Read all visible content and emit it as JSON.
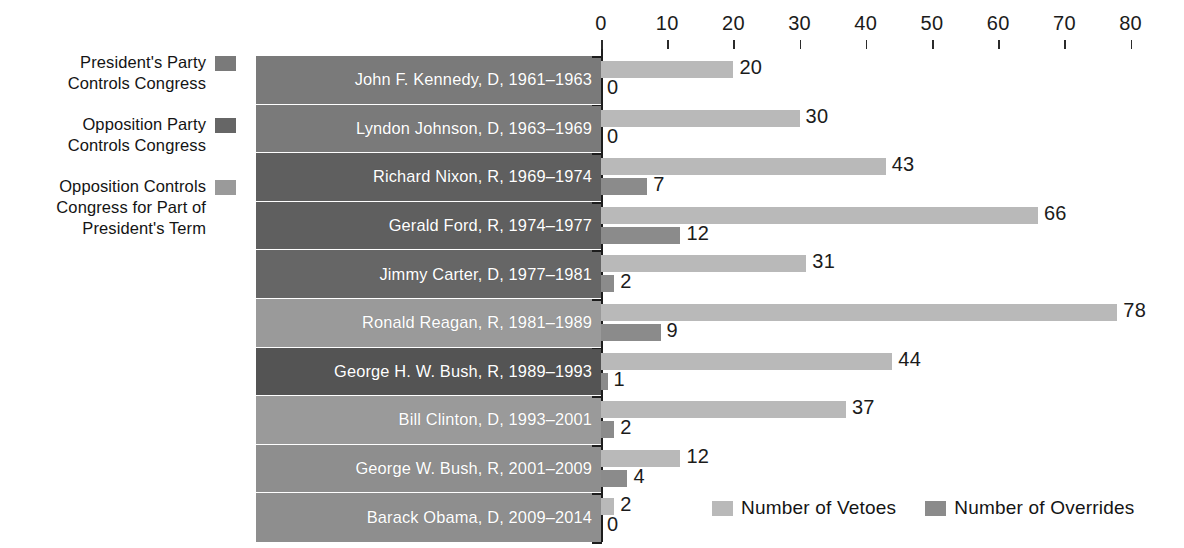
{
  "side_legend": {
    "items": [
      {
        "label": "President's Party\nControls Congress",
        "swatch_name": "swatch-president-party-controls",
        "color": "#7a7a7a"
      },
      {
        "label": "Opposition Party\nControls Congress",
        "swatch_name": "swatch-opposition-party-controls",
        "color": "#666666"
      },
      {
        "label": "Opposition Controls\nCongress for Part of\nPresident's Term",
        "swatch_name": "swatch-opposition-part-term",
        "color": "#9a9a9a"
      }
    ]
  },
  "bottom_legend": {
    "items": [
      {
        "label": "Number of Vetoes",
        "color": "#b9b9b9"
      },
      {
        "label": "Number of Overrides",
        "color": "#8b8b8b"
      }
    ]
  },
  "colors": {
    "veto_bar": "#b9b9b9",
    "override_bar": "#8b8b8b",
    "band_president_party": "#7a7a7a",
    "band_opposition_party": "#5f5f5f",
    "band_opposition_part": "#9a9a9a",
    "axis": "#1d1d1d",
    "background": "#ffffff"
  },
  "chart_data": {
    "type": "bar",
    "title": "",
    "xlabel": "",
    "ylabel": "",
    "orientation": "horizontal",
    "xlim": [
      0,
      80
    ],
    "xticks": [
      0,
      10,
      20,
      30,
      40,
      50,
      60,
      70,
      80
    ],
    "grid": false,
    "legend_position": "bottom-right",
    "categories": [
      "John F. Kennedy, D, 1961–1963",
      "Lyndon Johnson, D, 1963–1969",
      "Richard Nixon, R, 1969–1974",
      "Gerald Ford, R, 1974–1977",
      "Jimmy Carter, D, 1977–1981",
      "Ronald Reagan, R, 1981–1989",
      "George H. W. Bush, R, 1989–1993",
      "Bill Clinton, D, 1993–2001",
      "George W. Bush, R, 2001–2009",
      "Barack Obama, D, 2009–2014"
    ],
    "series": [
      {
        "name": "Number of Vetoes",
        "color": "#b9b9b9",
        "values": [
          20,
          30,
          43,
          66,
          31,
          78,
          44,
          37,
          12,
          2
        ]
      },
      {
        "name": "Number of Overrides",
        "color": "#8b8b8b",
        "values": [
          0,
          0,
          7,
          12,
          2,
          9,
          1,
          2,
          4,
          0
        ]
      }
    ],
    "row_band_colors": [
      "#7a7a7a",
      "#7a7a7a",
      "#5f5f5f",
      "#5f5f5f",
      "#666666",
      "#9a9a9a",
      "#545454",
      "#9a9a9a",
      "#8e8e8e",
      "#8e8e8e"
    ]
  }
}
